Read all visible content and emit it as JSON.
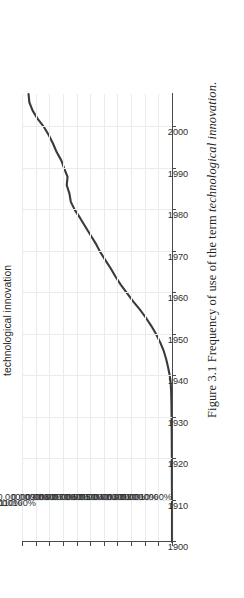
{
  "figure": {
    "caption_prefix": "Figure 3.1 Frequency of use of the term ",
    "caption_term": "technological innovation",
    "caption_suffix": "."
  },
  "chart_data": {
    "type": "line",
    "title": "technological innovation",
    "xlabel": "",
    "ylabel": "",
    "grid": true,
    "legend": "none",
    "line_color": "#3a3a3a",
    "grid_color": "#e9ecef",
    "axis_color": "#4a4a4a",
    "xlim": [
      1900,
      2008
    ],
    "ylim": [
      0.0,
      0.00011
    ],
    "xticks": [
      1900,
      1910,
      1920,
      1930,
      1940,
      1950,
      1960,
      1970,
      1980,
      1990,
      2000
    ],
    "xticklabels": [
      "1900",
      "1910",
      "1920",
      "1930",
      "1940",
      "1950",
      "1960",
      "1970",
      "1980",
      "1990",
      "2000"
    ],
    "yticks": [
      0.0,
      1e-05,
      2e-05,
      3e-05,
      4e-05,
      5e-05,
      6e-05,
      7e-05,
      8e-05,
      9e-05,
      0.0001,
      0.00011
    ],
    "yticklabels": [
      "0.0000000%",
      "0.0000010%",
      "0.0000020%",
      "0.0000030%",
      "0.0000040%",
      "0.0000050%",
      "0.0000060%",
      "0.0000070%",
      "0.0000080%",
      "0.0000090%",
      "0.000100%",
      "0.000110%"
    ],
    "x": [
      1900,
      1905,
      1910,
      1915,
      1920,
      1925,
      1930,
      1933,
      1936,
      1938,
      1940,
      1942,
      1944,
      1946,
      1948,
      1950,
      1952,
      1954,
      1956,
      1958,
      1960,
      1962,
      1964,
      1966,
      1968,
      1970,
      1972,
      1974,
      1976,
      1978,
      1980,
      1982,
      1984,
      1986,
      1988,
      1990,
      1992,
      1994,
      1996,
      1998,
      2000,
      2002,
      2004,
      2006,
      2008
    ],
    "values": [
      0.0,
      0.0,
      0.0,
      1e-07,
      1e-07,
      2e-07,
      3e-07,
      4e-07,
      6e-07,
      9e-07,
      1.6e-06,
      2.8e-06,
      4.2e-06,
      6e-06,
      8.5e-06,
      1.15e-05,
      1.5e-05,
      1.9e-05,
      2.35e-05,
      2.85e-05,
      3.3e-05,
      3.75e-05,
      4.15e-05,
      4.5e-05,
      4.9e-05,
      5.28e-05,
      5.6e-05,
      5.98e-05,
      6.35e-05,
      6.72e-05,
      7.12e-05,
      7.42e-05,
      7.52e-05,
      7.72e-05,
      7.66e-05,
      7.9e-05,
      8.12e-05,
      8.46e-05,
      8.72e-05,
      9.02e-05,
      9.38e-05,
      9.85e-05,
      0.0001022,
      0.0001046,
      0.0001052
    ]
  }
}
